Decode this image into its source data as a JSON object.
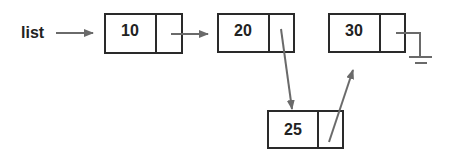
{
  "diagram": {
    "type": "linked-list-insertion",
    "head_label": "list",
    "nodes": [
      {
        "id": "n10",
        "value": "10"
      },
      {
        "id": "n20",
        "value": "20"
      },
      {
        "id": "n30",
        "value": "30"
      },
      {
        "id": "n25",
        "value": "25"
      }
    ],
    "edges": [
      {
        "from": "list",
        "to": "n10"
      },
      {
        "from": "n10",
        "to": "n20"
      },
      {
        "from": "n20",
        "to": "n25"
      },
      {
        "from": "n25",
        "to": "n30"
      },
      {
        "from": "n30",
        "to": "null-ground"
      }
    ],
    "colors": {
      "box_stroke": "#2a2a2a",
      "arrow": "#6a6a6a",
      "text": "#222222"
    }
  }
}
